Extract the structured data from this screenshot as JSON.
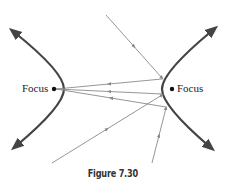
{
  "figure": {
    "caption": "Figure 7.30",
    "left_focus_label": "Focus",
    "right_focus_label": "Focus",
    "colors": {
      "curve": "#444444",
      "ray": "#8a8a8a",
      "text": "#222222"
    }
  },
  "diagram": {
    "type": "hyperbola-reflection",
    "branches": [
      {
        "name": "left",
        "top": [
          14,
          32
        ],
        "vertex": [
          64,
          89
        ],
        "bottom": [
          16,
          146
        ]
      },
      {
        "name": "right",
        "top": [
          213,
          30
        ],
        "vertex": [
          162,
          89
        ],
        "bottom": [
          210,
          147
        ]
      }
    ],
    "foci": [
      {
        "x": 54,
        "y": 89
      },
      {
        "x": 172,
        "y": 89
      }
    ],
    "incoming_rays": [
      {
        "from": [
          106,
          15
        ],
        "to": [
          162,
          78
        ]
      },
      {
        "from": [
          52,
          163
        ],
        "to": [
          162,
          95
        ]
      },
      {
        "from": [
          152,
          163
        ],
        "to": [
          166,
          108
        ]
      }
    ],
    "reflected_rays": [
      {
        "from": [
          162,
          79
        ],
        "to": [
          56,
          89
        ]
      },
      {
        "from": [
          162,
          94
        ],
        "to": [
          56,
          89
        ]
      },
      {
        "from": [
          166,
          107
        ],
        "to": [
          56,
          89
        ]
      }
    ]
  }
}
